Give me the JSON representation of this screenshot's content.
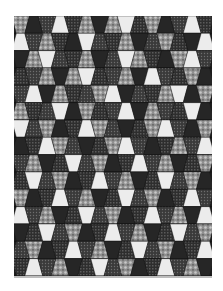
{
  "image": {
    "subject": "tumbler quilt pattern",
    "width": 223,
    "height": 291
  },
  "quilt": {
    "x": 14,
    "y": 16,
    "width": 198,
    "height": 260,
    "columns": 15,
    "rows": 15,
    "inset_ratio": 0.18,
    "fabrics": {
      "B": {
        "name": "black-solid",
        "color": "#262626"
      },
      "W": {
        "name": "white-solid",
        "color": "#ececec"
      },
      "D": {
        "name": "dark-dots",
        "color": "#3a3a3a",
        "dot": "#6e6e6e"
      },
      "C": {
        "name": "dark-check",
        "color": "#2e2e2e",
        "dot": "#5a5a5a"
      },
      "F": {
        "name": "gray-floral",
        "color": "#8f8f8f",
        "dot": "#c8c8c8"
      }
    },
    "grid": [
      "FBDWCFBFWCFBDWC",
      "WDFCBWDCFBDFCBW",
      "BFWDCFBDWFCBFWD",
      "CDFBFWCDFBWDCFB",
      "DWBFCDFWBDCFWBF",
      "FCDWBFCDWBFDCWB",
      "WDFBCWFDBCFWDBF",
      "BCWFDBCFWDBCFDW",
      "DFBCWDFBCWDFBCF",
      "CWDFBCWDFBCWDFB",
      "FBCWDFBCWDFBCWD",
      "WDFBCWDFBCWDFBW",
      "BCWDFBCWDFBCWDF",
      "DFBCWDFBCWDFBCW",
      "CWDFBCWDFBCWDFB"
    ]
  }
}
